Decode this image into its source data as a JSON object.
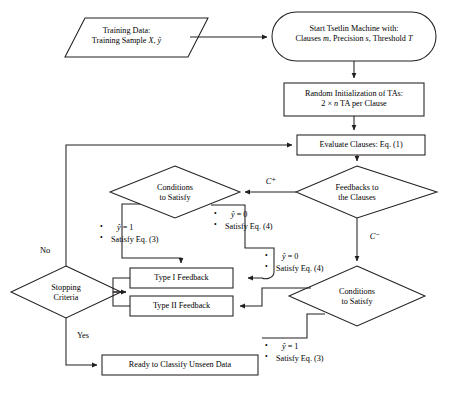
{
  "diagram": {
    "type": "flowchart",
    "stroke_color": "#231f20",
    "background_color": "#ffffff"
  },
  "nodes": {
    "training_data": {
      "shape": "parallelogram",
      "line1": "Training Data:",
      "line2": "Training Sample X, ŷ"
    },
    "start": {
      "shape": "stadium",
      "line1": "Start Tsetlin Machine with:",
      "line2": "Clauses m, Precision s, Threshold T"
    },
    "random_init": {
      "shape": "rectangle",
      "line1": "Random Initialization of TAs:",
      "line2": "2 × n TA per Clause"
    },
    "evaluate_clauses": {
      "shape": "rectangle",
      "line1": "Evaluate Clauses: Eq. (1)"
    },
    "feedbacks": {
      "shape": "diamond",
      "line1": "Feedbacks to",
      "line2": "the Clauses"
    },
    "conditions_top": {
      "shape": "diamond",
      "line1": "Conditions",
      "line2": "to Satisfy"
    },
    "conditions_bottom": {
      "shape": "diamond",
      "line1": "Conditions",
      "line2": "to Satisfy"
    },
    "type_i_feedback": {
      "shape": "rectangle",
      "line1": "Type I Feedback"
    },
    "type_ii_feedback": {
      "shape": "rectangle",
      "line1": "Type II Feedback"
    },
    "stopping_criteria": {
      "shape": "diamond",
      "line1": "Stopping",
      "line2": "Criteria"
    },
    "ready": {
      "shape": "rectangle",
      "line1": "Ready to Classify Unseen Data"
    }
  },
  "edge_labels": {
    "c_plus": "C⁺",
    "c_minus": "C⁻",
    "no": "No",
    "yes": "Yes"
  },
  "conditions": {
    "top_left": {
      "item1": "ŷ = 1",
      "item2": "Satisfy Eq. (3)"
    },
    "top_right": {
      "item1": "ŷ = 0",
      "item2": "Satisfy Eq. (4)"
    },
    "bottom_left": {
      "item1": "ŷ = 0",
      "item2": "Satisfy Eq. (4)"
    },
    "bottom_right": {
      "item1": "ŷ = 1",
      "item2": "Satisfy Eq. (3)"
    }
  }
}
